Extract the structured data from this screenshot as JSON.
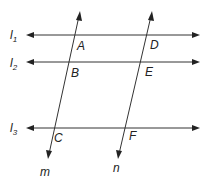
{
  "diagram": {
    "title": "",
    "lines": {
      "l1": {
        "label": "l",
        "sub": "1"
      },
      "l2": {
        "label": "l",
        "sub": "2"
      },
      "l3": {
        "label": "l",
        "sub": "3"
      },
      "m": {
        "label": "m"
      },
      "n": {
        "label": "n"
      }
    },
    "points": {
      "A": "A",
      "B": "B",
      "C": "C",
      "D": "D",
      "E": "E",
      "F": "F"
    },
    "colors": {
      "line": "#333333",
      "text": "#222222",
      "background": "#ffffff"
    }
  }
}
